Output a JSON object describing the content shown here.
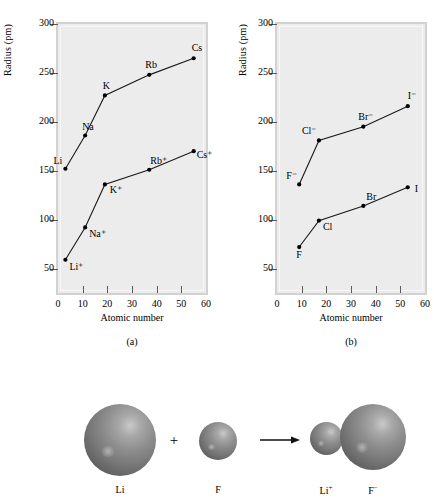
{
  "figure": {
    "axis_y_label": "Radius (pm)",
    "axis_x_label": "Atomic number",
    "caption_a": "(a)",
    "caption_b": "(b)",
    "y_ticks": [
      50,
      100,
      150,
      200,
      250,
      300
    ],
    "x_ticks": [
      0,
      10,
      20,
      30,
      40,
      50,
      60
    ],
    "plot_bg": "#ececec",
    "frame_color": "#d2d2d2",
    "line_color": "#1a1a1a"
  },
  "chart_data": [
    {
      "type": "line",
      "title": "(a)",
      "xlabel": "Atomic number",
      "ylabel": "Radius (pm)",
      "xlim": [
        0,
        60
      ],
      "ylim": [
        25,
        300
      ],
      "grid": false,
      "legend": "none",
      "series": [
        {
          "name": "Alkali metal atoms",
          "points": [
            {
              "label": "Li",
              "x": 3,
              "y": 152
            },
            {
              "label": "Na",
              "x": 11,
              "y": 186
            },
            {
              "label": "K",
              "x": 19,
              "y": 227
            },
            {
              "label": "Rb",
              "x": 37,
              "y": 248
            },
            {
              "label": "Cs",
              "x": 55,
              "y": 265
            }
          ]
        },
        {
          "name": "Alkali metal cations",
          "points": [
            {
              "label": "Li⁺",
              "x": 3,
              "y": 59
            },
            {
              "label": "Na⁺",
              "x": 11,
              "y": 92
            },
            {
              "label": "K⁺",
              "x": 19,
              "y": 136
            },
            {
              "label": "Rb⁺",
              "x": 37,
              "y": 151
            },
            {
              "label": "Cs⁺",
              "x": 55,
              "y": 170
            }
          ]
        }
      ]
    },
    {
      "type": "line",
      "title": "(b)",
      "xlabel": "Atomic number",
      "ylabel": "Radius (pm)",
      "xlim": [
        0,
        60
      ],
      "ylim": [
        25,
        300
      ],
      "grid": false,
      "legend": "none",
      "series": [
        {
          "name": "Halide anions",
          "points": [
            {
              "label": "F⁻",
              "x": 9,
              "y": 136
            },
            {
              "label": "Cl⁻",
              "x": 17,
              "y": 181
            },
            {
              "label": "Br⁻",
              "x": 35,
              "y": 195
            },
            {
              "label": "I⁻",
              "x": 53,
              "y": 216
            }
          ]
        },
        {
          "name": "Halogen atoms",
          "points": [
            {
              "label": "F",
              "x": 9,
              "y": 72
            },
            {
              "label": "Cl",
              "x": 17,
              "y": 99
            },
            {
              "label": "Br",
              "x": 35,
              "y": 114
            },
            {
              "label": "I",
              "x": 53,
              "y": 133
            }
          ]
        }
      ]
    }
  ],
  "illustration": {
    "plus_symbol": "+",
    "arrow_symbol": "arrow-right-icon",
    "species": [
      {
        "label": "Li",
        "sup": ""
      },
      {
        "label": "F",
        "sup": ""
      },
      {
        "label": "Li",
        "sup": "+"
      },
      {
        "label": "F",
        "sup": "−"
      }
    ]
  }
}
